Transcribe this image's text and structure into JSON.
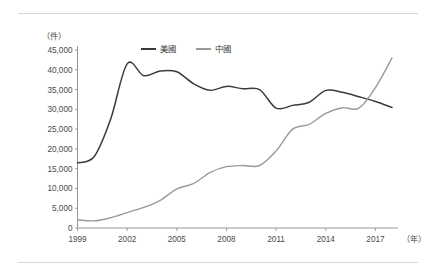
{
  "figure": {
    "y_unit_label": "（件）",
    "x_unit_label": "（年）",
    "legend": [
      {
        "key": "us",
        "label": "美國",
        "color": "#3b3b3b"
      },
      {
        "key": "china",
        "label": "中國",
        "color": "#9a9a9a"
      }
    ],
    "rules": {
      "top": true,
      "bottom": true
    }
  },
  "chart_data": {
    "type": "line",
    "title": "",
    "subtitle": "",
    "xlabel": "（年）",
    "ylabel": "（件）",
    "xlim": [
      1999,
      2018
    ],
    "ylim": [
      0,
      45000
    ],
    "grid": false,
    "legend_position": "top-center",
    "x": [
      1999,
      2000,
      2001,
      2002,
      2003,
      2004,
      2005,
      2006,
      2007,
      2008,
      2009,
      2010,
      2011,
      2012,
      2013,
      2014,
      2015,
      2016,
      2017,
      2018
    ],
    "xticks": [
      1999,
      2002,
      2005,
      2008,
      2011,
      2014,
      2017
    ],
    "xticklabels": [
      "1999",
      "2002",
      "2005",
      "2008",
      "2011",
      "2014",
      "2017"
    ],
    "yticks": [
      0,
      5000,
      10000,
      15000,
      20000,
      25000,
      30000,
      35000,
      40000,
      45000
    ],
    "yticklabels": [
      "0",
      "5,000",
      "10,000",
      "15,000",
      "20,000",
      "25,000",
      "30,000",
      "35,000",
      "40,000",
      "45,000"
    ],
    "series": [
      {
        "name": "美國",
        "key": "us",
        "color": "#3b3b3b",
        "values": [
          16500,
          18000,
          27500,
          41500,
          38500,
          39700,
          39500,
          36500,
          34800,
          35800,
          35200,
          35000,
          30300,
          31000,
          31800,
          34800,
          34300,
          33200,
          32000,
          30500
        ]
      },
      {
        "name": "中國",
        "key": "china",
        "color": "#9a9a9a",
        "values": [
          2100,
          1800,
          2600,
          3900,
          5200,
          7000,
          9900,
          11200,
          14000,
          15500,
          15800,
          15800,
          19500,
          25000,
          26200,
          29000,
          30400,
          30300,
          35500,
          43000
        ]
      }
    ],
    "annotations": []
  }
}
